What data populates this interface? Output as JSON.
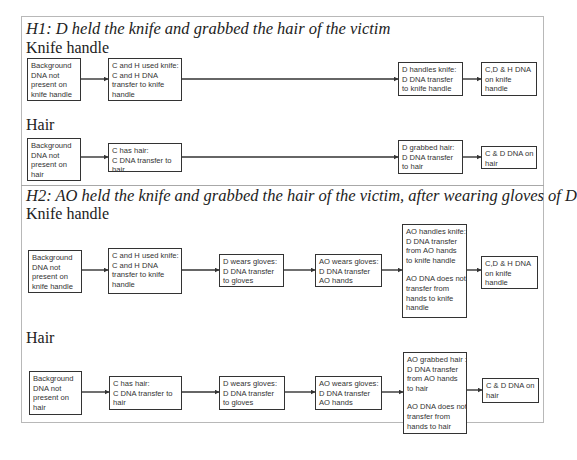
{
  "hypotheses": [
    {
      "title": "H1: D held the knife and grabbed the hair of the victim",
      "rows": [
        {
          "label": "Knife handle",
          "boxes": [
            {
              "lines": [
                "Background",
                "DNA not",
                "present on",
                "knife handle"
              ]
            },
            {
              "lines": [
                "C and H used knife:",
                "C and H DNA",
                "transfer to knife",
                "handle"
              ]
            },
            {
              "lines": [
                "D handles knife:",
                "D DNA transfer",
                "to knife handle"
              ]
            },
            {
              "lines": [
                "C,D & H DNA",
                "on knife",
                "handle"
              ]
            }
          ]
        },
        {
          "label": "Hair",
          "boxes": [
            {
              "lines": [
                "Background",
                "DNA not",
                "present on",
                "hair"
              ]
            },
            {
              "lines": [
                "C has hair:",
                "C DNA transfer to",
                "hair"
              ]
            },
            {
              "lines": [
                "D grabbed hair:",
                "D DNA transfer",
                "to hair"
              ]
            },
            {
              "lines": [
                "C & D DNA on",
                "hair"
              ]
            }
          ]
        }
      ]
    },
    {
      "title": "H2: AO held the knife and grabbed the hair of the victim, after wearing gloves of D",
      "rows": [
        {
          "label": "Knife handle",
          "boxes": [
            {
              "lines": [
                "Background",
                "DNA not",
                "present on",
                "knife handle"
              ]
            },
            {
              "lines": [
                "C and H used knife:",
                "C and H DNA",
                "transfer to knife",
                "handle"
              ]
            },
            {
              "lines": [
                "D wears gloves:",
                "D DNA transfer",
                "to gloves"
              ]
            },
            {
              "lines": [
                "AO wears gloves:",
                "D DNA transfer",
                "AO hands"
              ]
            },
            {
              "lines": [
                "AO handles knife:",
                "D DNA transfer",
                "from AO hands",
                "to knife handle"
              ],
              "lines2": [
                "AO DNA does not",
                "transfer from",
                "hands to knife",
                "handle"
              ]
            },
            {
              "lines": [
                "C,D & H DNA",
                "on knife",
                "handle"
              ]
            }
          ]
        },
        {
          "label": "Hair",
          "boxes": [
            {
              "lines": [
                "Background",
                "DNA not",
                "present on",
                "hair"
              ]
            },
            {
              "lines": [
                "C has hair:",
                "C DNA transfer to",
                "hair"
              ]
            },
            {
              "lines": [
                "D wears gloves:",
                "D DNA transfer",
                "to gloves"
              ]
            },
            {
              "lines": [
                "AO wears gloves:",
                "D DNA transfer",
                "AO hands"
              ]
            },
            {
              "lines": [
                "AO grabbed hair :",
                "D DNA transfer",
                "from AO hands",
                "to hair"
              ],
              "lines2": [
                "AO DNA does not",
                "transfer from",
                "hands to hair"
              ]
            },
            {
              "lines": [
                "C & D DNA on",
                "hair"
              ]
            }
          ]
        }
      ]
    }
  ],
  "colors": {
    "box_border": "#333333",
    "frame_border": "#b8b8b8",
    "arrow": "#333333",
    "text": "#333333"
  }
}
